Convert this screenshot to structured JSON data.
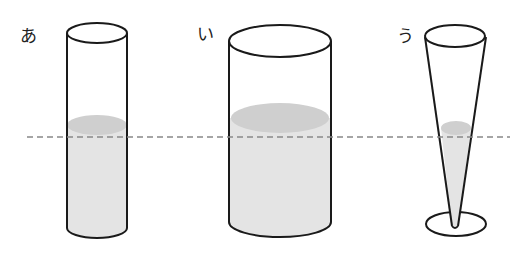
{
  "labels": {
    "a": "あ",
    "i": "い",
    "u": "う"
  },
  "colors": {
    "outline": "#1a1a1a",
    "water_body": "#e4e4e4",
    "water_surface": "#cfcfcf",
    "dashed_line": "#888888"
  },
  "containers": [
    {
      "id": "a",
      "label": "あ",
      "shape": "narrow cylinder"
    },
    {
      "id": "i",
      "label": "い",
      "shape": "wide cylinder"
    },
    {
      "id": "u",
      "label": "う",
      "shape": "inverted cone with base"
    }
  ],
  "reference_line": {
    "style": "dashed",
    "y": 137
  }
}
